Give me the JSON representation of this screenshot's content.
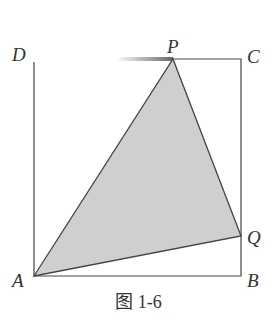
{
  "figure": {
    "caption": "图 1-6",
    "points": {
      "A": {
        "label": "A",
        "x": 34,
        "y": 276
      },
      "B": {
        "label": "B",
        "x": 241,
        "y": 276
      },
      "C": {
        "label": "C",
        "x": 241,
        "y": 59
      },
      "D": {
        "label": "D",
        "x": 34,
        "y": 59
      },
      "P": {
        "label": "P",
        "x": 173,
        "y": 59
      },
      "Q": {
        "label": "Q",
        "x": 241,
        "y": 236
      }
    },
    "shaded_triangle": [
      "A",
      "P",
      "Q"
    ],
    "colors": {
      "line": "#444444",
      "fill": "#cfcfcf"
    }
  }
}
